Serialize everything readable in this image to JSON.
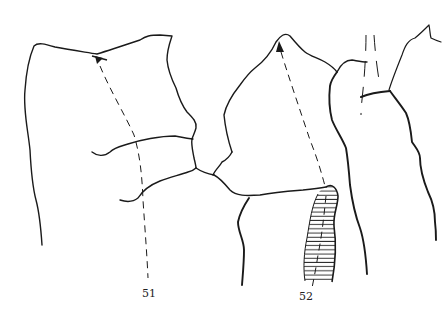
{
  "figure": {
    "labels": [
      {
        "id": "51",
        "text": "51"
      },
      {
        "id": "52",
        "text": "52"
      }
    ],
    "colors": {
      "ink": "#1a1a1a",
      "background": "#ffffff"
    },
    "elements": [
      {
        "name": "fragment-51-outline",
        "type": "solid-line"
      },
      {
        "name": "fragment-51-axis",
        "type": "dashed-arrow"
      },
      {
        "name": "fragment-52-outline",
        "type": "solid-line"
      },
      {
        "name": "fragment-52-axis",
        "type": "dashed-arrow"
      },
      {
        "name": "hatched-region",
        "type": "horizontal-hatching"
      },
      {
        "name": "right-fragment-outline",
        "type": "solid-line"
      }
    ]
  }
}
